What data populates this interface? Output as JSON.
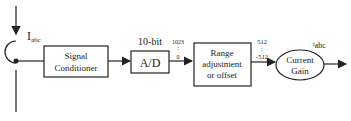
{
  "input": {
    "label_main": "I",
    "label_sub": "abc"
  },
  "blocks": {
    "signal_conditioner": [
      "Signal",
      "Conditioner"
    ],
    "adc": {
      "label": "A/D",
      "caption": "10-bit"
    },
    "range": [
      "Range",
      "adjustment",
      "or offset"
    ],
    "gain": [
      "Current",
      "Gain"
    ]
  },
  "ranges": {
    "adc_max": "1023",
    "adc_min": "0",
    "range_max": "512",
    "range_min": "-512"
  },
  "output": {
    "label_main": "i",
    "label_sub": "abc"
  }
}
